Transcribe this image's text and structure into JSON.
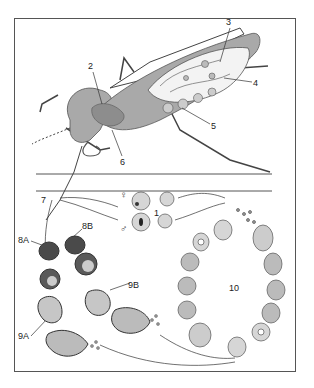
{
  "figure": {
    "labels": {
      "l1": "1",
      "l2": "2",
      "l3": "3",
      "l4": "4",
      "l5": "5",
      "l6": "6",
      "l7": "7",
      "l8A": "8A",
      "l8B": "8B",
      "l9A": "9A",
      "l9B": "9B",
      "l10": "10"
    },
    "symbols": {
      "female": "♀",
      "male": "♂"
    },
    "colors": {
      "body_gray": "#a9a9a9",
      "dark_cell": "#4a4a4a",
      "cell_fill": "#d6d6d6",
      "line": "#333333",
      "frame": "#555555"
    }
  }
}
